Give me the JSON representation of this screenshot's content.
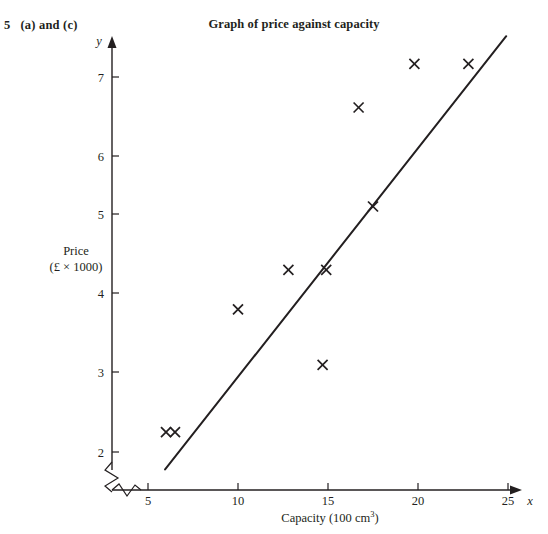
{
  "question": {
    "number": "5",
    "parts": "(a) and (c)",
    "full": "5  (a) and (c)"
  },
  "header": {
    "title": "Graph of price against capacity"
  },
  "chart_data": {
    "type": "scatter",
    "title": "Graph of price against capacity",
    "xlabel": "Capacity (100 cm³)",
    "ylabel": "Price (£ × 1000)",
    "y_axis_variable": "y",
    "x_axis_variable": "x",
    "xlim": [
      4.0,
      25.5
    ],
    "ylim": [
      1.55,
      7.45
    ],
    "xticks": [
      5,
      10,
      15,
      20,
      25
    ],
    "yticks": [
      2,
      3,
      4,
      5,
      6,
      7
    ],
    "xtick_labels": [
      "5",
      "10",
      "15",
      "20",
      "25"
    ],
    "ytick_labels": [
      "2",
      "3",
      "4",
      "5",
      "6",
      "7"
    ],
    "grid": false,
    "legend": null,
    "axis_break_x": true,
    "axis_break_y": true,
    "marker": "x",
    "points": [
      {
        "x": 6.0,
        "y": 2.25
      },
      {
        "x": 6.5,
        "y": 2.25
      },
      {
        "x": 10.0,
        "y": 3.8
      },
      {
        "x": 12.8,
        "y": 4.3
      },
      {
        "x": 14.7,
        "y": 3.1
      },
      {
        "x": 14.9,
        "y": 4.3
      },
      {
        "x": 16.7,
        "y": 6.35
      },
      {
        "x": 17.5,
        "y": 5.1
      },
      {
        "x": 19.8,
        "y": 6.9
      },
      {
        "x": 22.8,
        "y": 6.9
      }
    ],
    "line_of_best_fit": {
      "type": "line",
      "x_start": 5.95,
      "y_start": 1.78,
      "x_end": 24.9,
      "y_end": 7.25
    }
  },
  "labels": {
    "y_axis_line1": "Price",
    "y_axis_line2": "(£ × 1000)",
    "x_axis_prefix": "Capacity (100 cm",
    "x_axis_sup": "3",
    "x_axis_suffix": ")"
  }
}
